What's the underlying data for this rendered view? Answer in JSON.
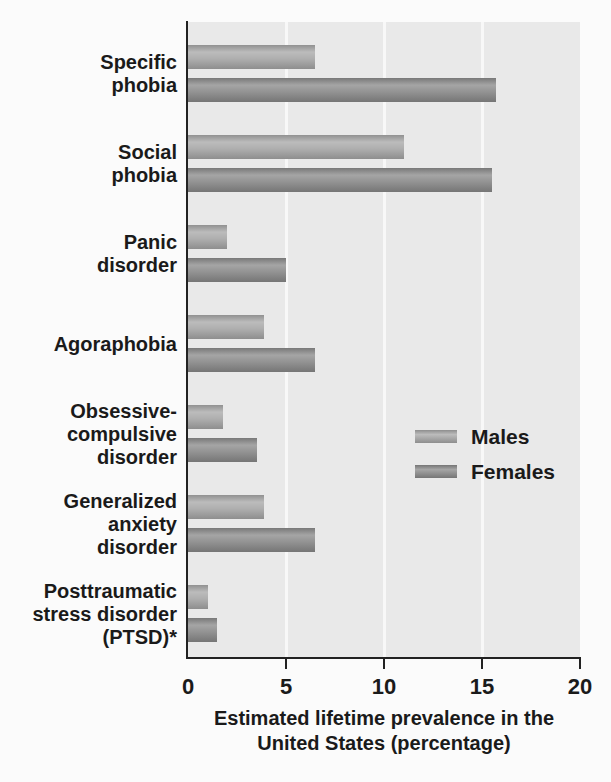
{
  "figure": {
    "kind": "scanned textbook bar chart",
    "page_background": "#fbfbfb",
    "text_color": "#1a1a1a"
  },
  "chart_data": {
    "type": "bar",
    "orientation": "horizontal",
    "categories": [
      "Specific\nphobia",
      "Social\nphobia",
      "Panic\ndisorder",
      "Agoraphobia",
      "Obsessive-\ncompulsive\ndisorder",
      "Generalized\nanxiety\ndisorder",
      "Posttraumatic\nstress disorder\n(PTSD)*"
    ],
    "series": [
      {
        "name": "Males",
        "color": "#a9a9a9",
        "values": [
          6.5,
          11.0,
          2.0,
          3.9,
          1.8,
          3.9,
          1.0
        ]
      },
      {
        "name": "Females",
        "color": "#8c8c8c",
        "values": [
          15.7,
          15.5,
          5.0,
          6.5,
          3.5,
          6.5,
          1.5
        ]
      }
    ],
    "title": "",
    "xlabel": "Estimated lifetime prevalence in the\nUnited States (percentage)",
    "ylabel": "",
    "xlim": [
      0,
      20
    ],
    "xticks": [
      0,
      5,
      10,
      15,
      20
    ],
    "gridlines_at": [
      5,
      10,
      15
    ],
    "grid_on": true,
    "plot_bg_color": "#e9e9e9",
    "grid_color": "#f8f8f8",
    "axis_color": "#222222",
    "legend": {
      "position": "inside-right",
      "entries": [
        "Males",
        "Females"
      ]
    }
  }
}
